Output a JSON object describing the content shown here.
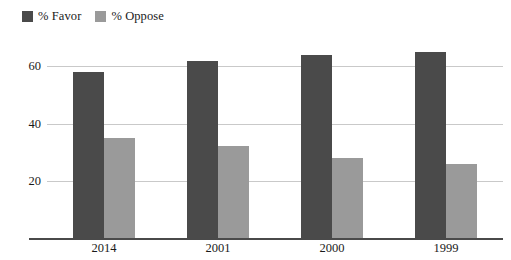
{
  "legend": {
    "position": "top-left",
    "entries": [
      {
        "label": "% Favor",
        "color": "#4a4a4a",
        "swatch_name": "legend-swatch-favor"
      },
      {
        "label": "% Oppose",
        "color": "#9a9a9a",
        "swatch_name": "legend-swatch-oppose"
      }
    ]
  },
  "axis": {
    "y_ticks": [
      "20",
      "40",
      "60"
    ],
    "x_ticks": [
      "2014",
      "2001",
      "2000",
      "1999"
    ]
  },
  "chart_data": {
    "type": "bar",
    "title": "",
    "subtitle": "",
    "xlabel": "",
    "ylabel": "",
    "categories": [
      "2014",
      "2001",
      "2000",
      "1999"
    ],
    "series": [
      {
        "name": "% Favor",
        "color": "#4a4a4a",
        "values": [
          58,
          62,
          64,
          65
        ]
      },
      {
        "name": "% Oppose",
        "color": "#9a9a9a",
        "values": [
          35,
          32,
          28,
          26
        ]
      }
    ],
    "ylim": [
      0,
      72
    ],
    "yticks": [
      20,
      40,
      60
    ],
    "grid": true,
    "grid_axis": "y",
    "legend_position": "top-left",
    "bar_layout": "grouped",
    "background": "#ffffff"
  }
}
